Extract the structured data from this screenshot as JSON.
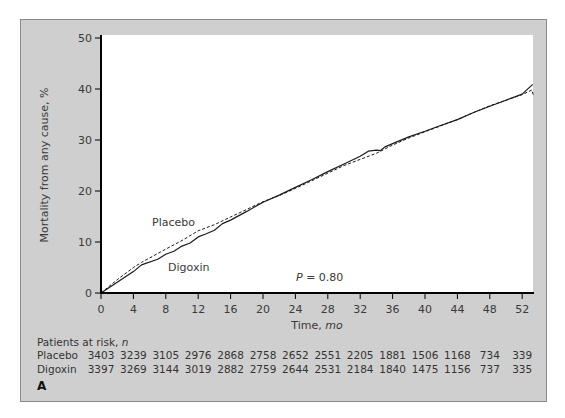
{
  "figure": {
    "panel_label": "A",
    "pvalue_prefix": "P",
    "pvalue_rest": " = 0.80",
    "series_labels": {
      "placebo": "Placebo",
      "digoxin": "Digoxin"
    },
    "risk_table": {
      "title_main": "Patients at risk, ",
      "title_italic": "n",
      "rows": [
        {
          "label": "Placebo",
          "values": [
            3403,
            3239,
            3105,
            2976,
            2868,
            2758,
            2652,
            2551,
            2205,
            1881,
            1506,
            1168,
            734,
            339
          ]
        },
        {
          "label": "Digoxin",
          "values": [
            3397,
            3269,
            3144,
            3019,
            2882,
            2759,
            2644,
            2531,
            2184,
            1840,
            1475,
            1156,
            737,
            335
          ]
        }
      ]
    },
    "colors": {
      "panel_bg": "#cfcfcf",
      "plot_bg": "#ffffff",
      "axis": "#000000",
      "line": "#1a1a1a",
      "text": "#3a3a3a"
    }
  },
  "chart_data": {
    "type": "line",
    "title": "",
    "xlabel": "Time, mo",
    "xlabel_main": "Time, ",
    "xlabel_italic": "mo",
    "ylabel": "Mortality from any cause, %",
    "xlim": [
      0,
      53.5
    ],
    "ylim": [
      0,
      50
    ],
    "xticks": [
      0,
      4,
      8,
      12,
      16,
      20,
      24,
      28,
      32,
      36,
      40,
      44,
      48,
      52
    ],
    "yticks": [
      0,
      10,
      20,
      30,
      40,
      50
    ],
    "grid": false,
    "legend": "inline labels",
    "annotations": [
      "Placebo",
      "Digoxin",
      "P = 0.80"
    ],
    "series": [
      {
        "name": "Placebo",
        "style": "dashed",
        "x": [
          0,
          2,
          4,
          5,
          8,
          10,
          12,
          14,
          16,
          18,
          20,
          22,
          24,
          26,
          28,
          30,
          32,
          34,
          36,
          38,
          40,
          42,
          44,
          46,
          48,
          50,
          52,
          53.2,
          53.4
        ],
        "y": [
          0,
          2.6,
          5.0,
          6.0,
          8.6,
          10.3,
          12.2,
          13.4,
          14.9,
          16.4,
          17.9,
          19.1,
          20.5,
          22.0,
          23.5,
          25.0,
          26.2,
          27.4,
          29.0,
          30.4,
          31.6,
          32.8,
          34.0,
          35.4,
          36.7,
          37.8,
          38.9,
          39.8,
          38.7
        ]
      },
      {
        "name": "Digoxin",
        "style": "solid",
        "x": [
          0,
          2,
          4,
          5,
          7,
          8,
          9,
          10,
          11,
          12,
          13,
          14,
          15,
          16,
          18,
          20,
          22,
          24,
          26,
          28,
          30,
          32,
          33,
          34,
          34.5,
          35,
          36,
          38,
          40,
          42,
          44,
          46,
          48,
          50,
          52,
          53.3
        ],
        "y": [
          0,
          2.1,
          4.2,
          5.5,
          6.6,
          7.6,
          8.2,
          9.2,
          9.8,
          11.0,
          11.6,
          12.3,
          13.6,
          14.3,
          16.0,
          17.8,
          19.2,
          20.7,
          22.2,
          23.8,
          25.3,
          26.8,
          27.8,
          28.0,
          27.9,
          28.6,
          29.3,
          30.6,
          31.7,
          32.9,
          34.0,
          35.4,
          36.6,
          37.8,
          39.0,
          40.9
        ]
      }
    ],
    "risk_table": {
      "title": "Patients at risk, n",
      "times": [
        0,
        4,
        8,
        12,
        16,
        20,
        24,
        28,
        32,
        36,
        40,
        44,
        48,
        52
      ],
      "Placebo": [
        3403,
        3239,
        3105,
        2976,
        2868,
        2758,
        2652,
        2551,
        2205,
        1881,
        1506,
        1168,
        734,
        339
      ],
      "Digoxin": [
        3397,
        3269,
        3144,
        3019,
        2882,
        2759,
        2644,
        2531,
        2184,
        1840,
        1475,
        1156,
        737,
        335
      ]
    }
  }
}
